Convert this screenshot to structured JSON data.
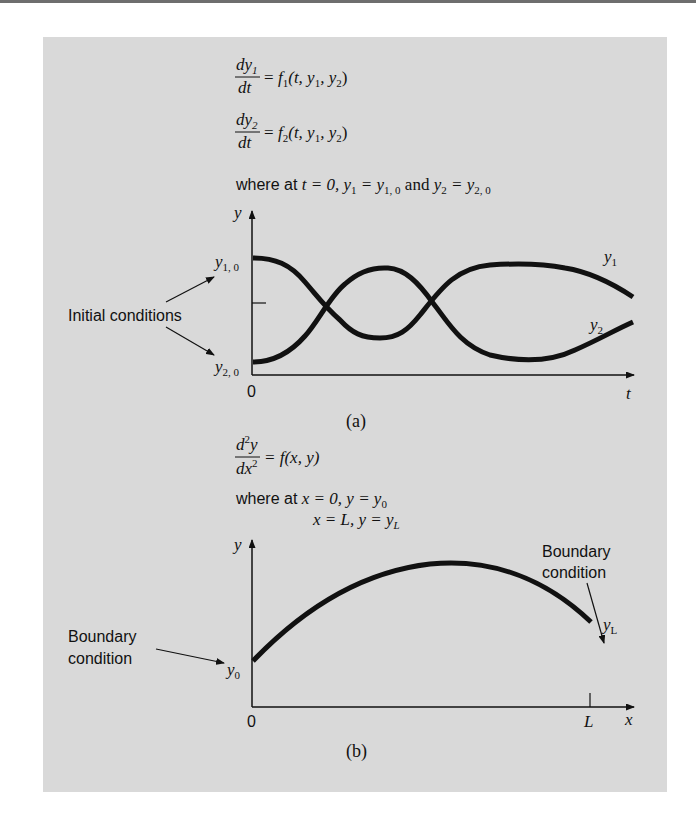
{
  "colors": {
    "panel_bg": "#d9d9d9",
    "ink": "#111111",
    "page_bg": "#ffffff"
  },
  "part_a": {
    "eq1": {
      "num": "dy",
      "num_sub": "1",
      "den": "dt",
      "rhs_f": "f",
      "rhs_f_sub": "1",
      "rhs_args_1": "(t, y",
      "rhs_args_1_sub": "1",
      "rhs_args_2": ", y",
      "rhs_args_2_sub": "2",
      "rhs_close": ")"
    },
    "eq2": {
      "num": "dy",
      "num_sub": "2",
      "den": "dt",
      "rhs_f": "f",
      "rhs_f_sub": "2",
      "rhs_args_1": "(t, y",
      "rhs_args_1_sub": "1",
      "rhs_args_2": ", y",
      "rhs_args_2_sub": "2",
      "rhs_close": ")"
    },
    "condition": {
      "prefix": "where at ",
      "t_eq": "t = 0, ",
      "y1": "y",
      "y1_sub": "1",
      "eq1": " = y",
      "y10_sub": "1, 0",
      "and": " and ",
      "y2": "y",
      "y2_sub": "2",
      "eq2": " = y",
      "y20_sub": "2, 0"
    },
    "y_axis_label": "y",
    "x_axis_label": "t",
    "origin_label": "0",
    "y10_label": "y",
    "y10_label_sub": "1, 0",
    "y20_label": "y",
    "y20_label_sub": "2, 0",
    "curve1_label": "y",
    "curve1_label_sub": "1",
    "curve2_label": "y",
    "curve2_label_sub": "2",
    "annotation": "Initial conditions",
    "caption": "(a)"
  },
  "part_b": {
    "eq": {
      "num": "d",
      "num_sup": "2",
      "num_y": "y",
      "den": "dx",
      "den_sup": "2",
      "rhs": "= f(x, y)"
    },
    "condition_line1": {
      "prefix": "where at ",
      "math": "x = 0, y = y",
      "sub": "0"
    },
    "condition_line2": {
      "math": "x = L, y = y",
      "sub": "L"
    },
    "y_axis_label": "y",
    "x_axis_label": "x",
    "origin_label": "0",
    "L_label": "L",
    "y0_label": "y",
    "y0_label_sub": "0",
    "yL_label": "y",
    "yL_label_sub": "L",
    "annotation_left_line1": "Boundary",
    "annotation_left_line2": "condition",
    "annotation_right_line1": "Boundary",
    "annotation_right_line2": "condition",
    "caption": "(b)"
  }
}
